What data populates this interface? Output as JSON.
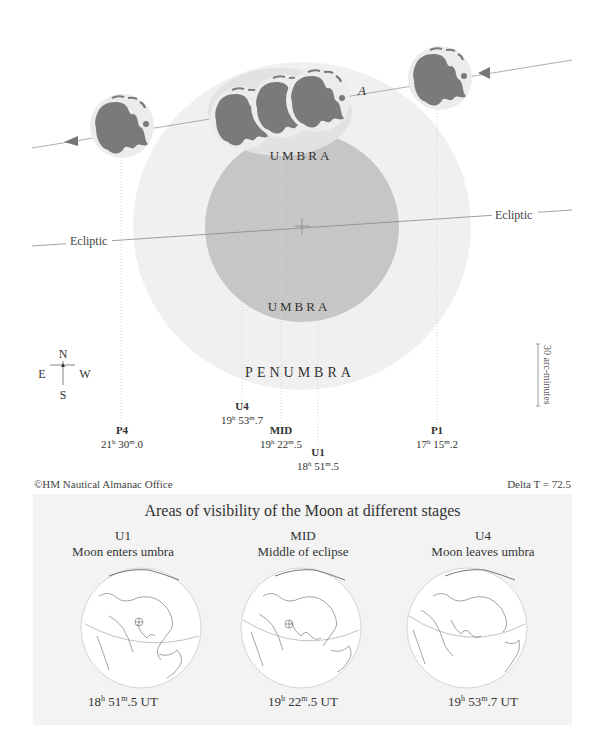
{
  "diagram": {
    "labels": {
      "umbra_top": "UMBRA",
      "umbra_bottom": "UMBRA",
      "penumbra_bottom": "PENUMBRA",
      "penumbra_top_partial": "A",
      "ecliptic_left": "Ecliptic",
      "ecliptic_right": "Ecliptic"
    },
    "compass": {
      "north": "N",
      "south": "S",
      "east": "E",
      "west": "W"
    },
    "scale_bar": {
      "label": "30 arc-minutes"
    },
    "contacts": [
      {
        "id": "P4",
        "label": "P4",
        "h": "21",
        "m": "30",
        "frac": "0"
      },
      {
        "id": "U4",
        "label": "U4",
        "h": "19",
        "m": "53",
        "frac": "7"
      },
      {
        "id": "MID",
        "label": "MID",
        "h": "19",
        "m": "22",
        "frac": "5"
      },
      {
        "id": "U1",
        "label": "U1",
        "h": "18",
        "m": "51",
        "frac": "5"
      },
      {
        "id": "P1",
        "label": "P1",
        "h": "17",
        "m": "15",
        "frac": "2"
      }
    ],
    "colors": {
      "penumbra": "#f0f0f0",
      "umbra": "#c6c6c6",
      "moon_maria": "#7a7a7a",
      "moon_disk": "#e6e6e6"
    }
  },
  "footer": {
    "credit": "©HM Nautical Almanac Office",
    "delta_t": "Delta T = 72.5"
  },
  "visibility_panel": {
    "title": "Areas of visibility of the Moon at different stages",
    "stages": [
      {
        "code": "U1",
        "description": "Moon enters umbra",
        "h": "18",
        "m": "51",
        "frac": "5",
        "unit": "UT"
      },
      {
        "code": "MID",
        "description": "Middle of eclipse",
        "h": "19",
        "m": "22",
        "frac": "5",
        "unit": "UT"
      },
      {
        "code": "U4",
        "description": "Moon leaves umbra",
        "h": "19",
        "m": "53",
        "frac": "7",
        "unit": "UT"
      }
    ]
  }
}
